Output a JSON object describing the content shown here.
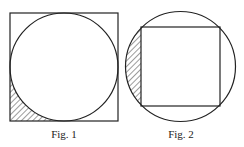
{
  "figures": [
    {
      "caption": "Fig. 1",
      "description": "Circle inscribed in a square; lower-left corner region between square and circle is hatched"
    },
    {
      "caption": "Fig. 2",
      "description": "Square inscribed in a circle; left circular segment outside the square is hatched"
    }
  ],
  "colors": {
    "stroke": "#222222",
    "background": "#ffffff"
  }
}
